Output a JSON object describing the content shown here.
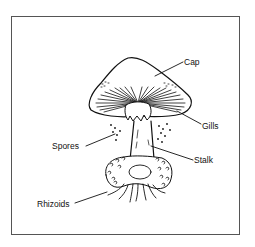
{
  "diagram": {
    "labels": [
      {
        "id": "cap",
        "text": "Cap"
      },
      {
        "id": "gills",
        "text": "Gills"
      },
      {
        "id": "spores",
        "text": "Spores"
      },
      {
        "id": "stalk",
        "text": "Stalk"
      },
      {
        "id": "rhizoids",
        "text": "Rhizoids"
      }
    ]
  },
  "colors": {
    "ink": "#111111",
    "frame": "#555555",
    "background": "#ffffff"
  }
}
